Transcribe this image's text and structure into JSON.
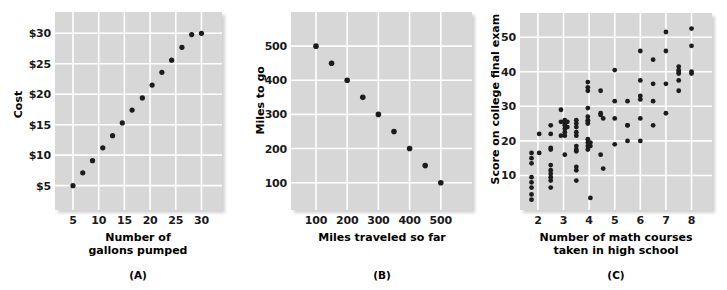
{
  "figure": {
    "title": "",
    "background": "#ffffff",
    "panel_background": "#d7d7d7",
    "gridline_color": "#ffffff",
    "point_color": "#1c1c1c"
  },
  "chart_data": [
    {
      "id": "A",
      "type": "scatter",
      "title": "",
      "caption": "(A)",
      "xlabel": "Number of\ngallons pumped",
      "ylabel": "Cost",
      "xticks": [
        5,
        10,
        15,
        20,
        25,
        30
      ],
      "xticklabels": [
        "5",
        "10",
        "15",
        "20",
        "25",
        "30"
      ],
      "yticks": [
        5,
        10,
        15,
        20,
        25,
        30
      ],
      "yticklabels": [
        "$5",
        "$10",
        "$15",
        "$20",
        "$25",
        "$30"
      ],
      "xlim": [
        1.5,
        34
      ],
      "ylim": [
        1.0,
        33.5
      ],
      "grid": true,
      "relationship": "perfect positive linear",
      "x": [
        5.0,
        6.9,
        8.8,
        10.8,
        12.7,
        14.6,
        16.5,
        18.5,
        20.4,
        22.3,
        24.2,
        26.2,
        28.1,
        30.0
      ],
      "y": [
        5.0,
        7.1,
        9.1,
        11.2,
        13.2,
        15.3,
        17.4,
        19.4,
        21.5,
        23.6,
        25.6,
        27.7,
        29.8,
        30.0
      ]
    },
    {
      "id": "B",
      "type": "scatter",
      "title": "",
      "caption": "(B)",
      "xlabel": "Miles traveled so far",
      "ylabel": "Miles to go",
      "xticks": [
        100,
        200,
        300,
        400,
        500
      ],
      "xticklabels": [
        "100",
        "200",
        "300",
        "400",
        "500"
      ],
      "yticks": [
        100,
        200,
        300,
        400,
        500
      ],
      "yticklabels": [
        "100",
        "200",
        "300",
        "400",
        "500"
      ],
      "xlim": [
        20,
        600
      ],
      "ylim": [
        20,
        600
      ],
      "grid": true,
      "relationship": "perfect negative linear",
      "x": [
        100,
        150,
        200,
        250,
        300,
        350,
        400,
        450,
        500
      ],
      "y": [
        500,
        450,
        400,
        350,
        300,
        250,
        200,
        150,
        100
      ]
    },
    {
      "id": "C",
      "type": "scatter",
      "title": "",
      "caption": "(C)",
      "xlabel": "Number of math courses\ntaken in high school",
      "ylabel": "Score on college final exam",
      "xticks": [
        2,
        3,
        4,
        5,
        6,
        7,
        8
      ],
      "xticklabels": [
        "2",
        "3",
        "4",
        "5",
        "6",
        "7",
        "8"
      ],
      "yticks": [
        10,
        20,
        30,
        40,
        50
      ],
      "yticklabels": [
        "10",
        "20",
        "30",
        "40",
        "50"
      ],
      "xlim": [
        1.3,
        8.8
      ],
      "ylim": [
        0,
        57
      ],
      "grid": true,
      "relationship": "moderate positive linear with scatter",
      "x": [
        1.75,
        1.75,
        1.75,
        1.75,
        1.75,
        1.75,
        1.75,
        1.75,
        2.05,
        2.05,
        2.5,
        2.5,
        2.5,
        2.5,
        2.5,
        2.5,
        2.5,
        2.5,
        2.5,
        2.5,
        2.9,
        2.9,
        2.9,
        3.05,
        3.05,
        3.05,
        3.05,
        3.05,
        3.05,
        3.05,
        3.15,
        3.15,
        3.5,
        3.5,
        3.5,
        3.5,
        3.5,
        3.5,
        3.5,
        3.5,
        3.5,
        3.5,
        3.5,
        3.95,
        3.95,
        3.95,
        3.95,
        3.95,
        3.95,
        3.95,
        3.95,
        3.95,
        3.95,
        3.95,
        3.95,
        4.05,
        4.05,
        4.05,
        4.45,
        4.45,
        4.45,
        4.45,
        4.55,
        4.55,
        5.0,
        5.0,
        5.0,
        5.0,
        5.5,
        5.5,
        5.5,
        5.5,
        6.0,
        6.0,
        6.0,
        6.0,
        6.0,
        6.0,
        6.5,
        6.5,
        6.5,
        6.5,
        7.0,
        7.0,
        7.0,
        7.0,
        7.5,
        7.5,
        7.5,
        7.5,
        7.5,
        7.5,
        8.0,
        8.0,
        8.0,
        8.0
      ],
      "y": [
        16.5,
        15.0,
        13.5,
        9.5,
        8.0,
        6.5,
        4.5,
        3.0,
        22.0,
        16.5,
        24.5,
        22.0,
        18.0,
        17.5,
        13.0,
        11.5,
        10.5,
        9.5,
        8.5,
        6.5,
        29.0,
        25.5,
        21.5,
        26.0,
        25.0,
        24.5,
        23.5,
        22.5,
        21.5,
        16.0,
        25.5,
        24.0,
        26.0,
        25.0,
        24.0,
        22.5,
        21.5,
        18.5,
        17.5,
        17.0,
        12.5,
        11.5,
        8.5,
        37.0,
        35.5,
        34.5,
        29.5,
        27.0,
        26.0,
        25.5,
        25.0,
        20.5,
        19.5,
        18.5,
        17.5,
        19.5,
        18.5,
        3.5,
        34.5,
        28.0,
        27.5,
        16.0,
        26.5,
        12.0,
        40.5,
        31.5,
        26.5,
        19.0,
        31.5,
        24.5,
        24.5,
        20.0,
        46.0,
        37.5,
        33.0,
        32.0,
        26.5,
        20.0,
        43.5,
        36.5,
        31.5,
        24.5,
        51.5,
        46.0,
        36.5,
        28.0,
        41.5,
        40.5,
        40.0,
        39.5,
        37.5,
        34.5,
        52.5,
        47.5,
        40.0,
        39.5
      ]
    }
  ]
}
